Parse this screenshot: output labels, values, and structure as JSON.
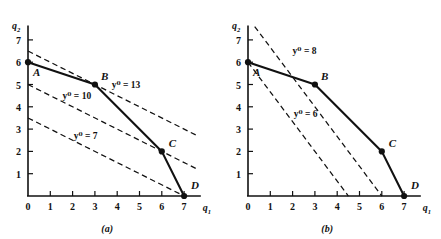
{
  "figure": {
    "background": "#ffffff",
    "ink": "#111111",
    "panels": [
      {
        "id": "a",
        "caption": "(a)",
        "x_axis": {
          "label": "q",
          "subscript": "1",
          "ticks": [
            "0",
            "1",
            "2",
            "3",
            "4",
            "5",
            "6",
            "7"
          ],
          "range": [
            0,
            7.6
          ]
        },
        "y_axis": {
          "label": "q",
          "subscript": "2",
          "ticks": [
            "0",
            "1",
            "2",
            "3",
            "4",
            "5",
            "6",
            "7"
          ],
          "range": [
            0,
            7.6
          ]
        },
        "frontier": {
          "name": "isoquant-frontier",
          "points": [
            {
              "label": "A",
              "x": 0,
              "y": 6,
              "dot": true,
              "label_dx": 5,
              "label_dy": 14
            },
            {
              "label": "B",
              "x": 3,
              "y": 5,
              "dot": true,
              "label_dx": 6,
              "label_dy": -5
            },
            {
              "label": "C",
              "x": 6,
              "y": 2,
              "dot": true,
              "label_dx": 7,
              "label_dy": -4
            },
            {
              "label": "D",
              "x": 7,
              "y": 0,
              "dot": true,
              "label_dx": 7,
              "label_dy": -7
            }
          ]
        },
        "isoquants": [
          {
            "name": "iso-7",
            "label": "y⁰ = 7",
            "value": 7,
            "slope": -0.5,
            "intercept": 3.5,
            "label_x": 2.05,
            "label_y": 2.55
          },
          {
            "name": "iso-10",
            "label": "y⁰ = 10",
            "value": 10,
            "slope": -0.5,
            "intercept": 5.0,
            "label_x": 1.55,
            "label_y": 4.35
          },
          {
            "name": "iso-13",
            "label": "y⁰ = 13",
            "value": 13,
            "slope": -0.5,
            "intercept": 6.5,
            "label_x": 3.75,
            "label_y": 4.85
          }
        ],
        "arrows": [
          {
            "name": "arrow-to-A",
            "x": 0.0,
            "y": 6.0
          },
          {
            "name": "arrow-to-B",
            "x": 3.0,
            "y": 5.0
          },
          {
            "name": "arrow-to-D",
            "x": 7.0,
            "y": 0.0
          }
        ]
      },
      {
        "id": "b",
        "caption": "(b)",
        "x_axis": {
          "label": "q",
          "subscript": "1",
          "ticks": [
            "0",
            "1",
            "2",
            "3",
            "4",
            "5",
            "6",
            "7"
          ],
          "range": [
            0,
            7.6
          ]
        },
        "y_axis": {
          "label": "q",
          "subscript": "2",
          "ticks": [
            "0",
            "1",
            "2",
            "3",
            "4",
            "5",
            "6",
            "7"
          ],
          "range": [
            0,
            7.6
          ]
        },
        "frontier": {
          "name": "isoquant-frontier",
          "points": [
            {
              "label": "A",
              "x": 0,
              "y": 6,
              "dot": true,
              "label_dx": 5,
              "label_dy": 14
            },
            {
              "label": "B",
              "x": 3,
              "y": 5,
              "dot": true,
              "label_dx": 6,
              "label_dy": -5
            },
            {
              "label": "C",
              "x": 6,
              "y": 2,
              "dot": true,
              "label_dx": 7,
              "label_dy": -4
            },
            {
              "label": "D",
              "x": 7,
              "y": 0,
              "dot": true,
              "label_dx": 7,
              "label_dy": -7
            }
          ]
        },
        "isoquants": [
          {
            "name": "iso-6",
            "label": "y⁰ = 6",
            "value": 6,
            "slope": -1.3333,
            "intercept": 6.0,
            "label_x": 2.05,
            "label_y": 3.55
          },
          {
            "name": "iso-8",
            "label": "y⁰ = 8",
            "value": 8,
            "slope": -1.3333,
            "intercept": 8.0,
            "label_x": 2.0,
            "label_y": 6.35
          }
        ],
        "arrows": [
          {
            "name": "arrow-to-A",
            "x": 0.0,
            "y": 6.0
          },
          {
            "name": "arrow-to-D",
            "x": 6.0,
            "y": 0.0
          },
          {
            "name": "arrow-to-D2",
            "x": 7.0,
            "y": 0.0
          }
        ]
      }
    ]
  }
}
